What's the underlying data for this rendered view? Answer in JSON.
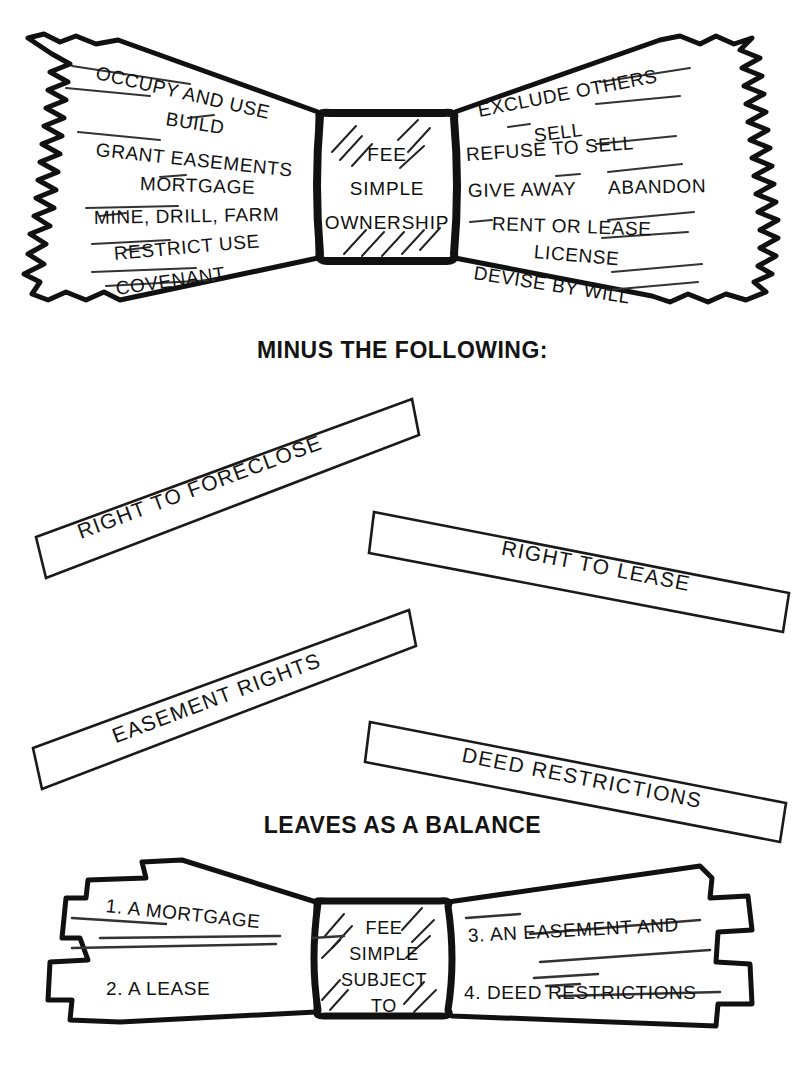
{
  "document": {
    "title": "Fee Simple Ownership — Bundle of Rights Diagram",
    "ink_color": "#111111",
    "paper_color": "#ffffff"
  },
  "top_diagram": {
    "name": "bundle-of-rights-bowtie",
    "core": {
      "line1": "FEE",
      "line2": "SIMPLE",
      "line3": "OWNERSHIP"
    },
    "left_rights": [
      "OCCUPY AND USE",
      "BUILD",
      "GRANT EASEMENTS",
      "MORTGAGE",
      "MINE, DRILL, FARM",
      "RESTRICT USE",
      "COVENANT"
    ],
    "right_rights": [
      "EXCLUDE OTHERS",
      "SELL",
      "REFUSE TO SELL",
      "GIVE AWAY",
      "ABANDON",
      "RENT OR LEASE",
      "LICENSE",
      "DEVISE BY WILL"
    ]
  },
  "minus_heading": "MINUS THE FOLLOWING:",
  "minus_bars": [
    {
      "label": "RIGHT TO FORECLOSE",
      "angle_deg": -20.5
    },
    {
      "label": "RIGHT TO LEASE",
      "angle_deg": 11.0
    },
    {
      "label": "EASEMENT RIGHTS",
      "angle_deg": -20.5
    },
    {
      "label": "DEED RESTRICTIONS",
      "angle_deg": 11.0
    }
  ],
  "leaves_heading": "LEAVES AS A BALANCE",
  "bottom_diagram": {
    "name": "fee-simple-subject-to-bowtie",
    "core": {
      "line1": "FEE",
      "line2": "SIMPLE",
      "line3": "SUBJECT",
      "line4": "TO"
    },
    "left_items": [
      "1. A MORTGAGE",
      "2. A LEASE"
    ],
    "right_items": [
      "3. AN EASEMENT AND",
      "4. DEED RESTRICTIONS"
    ]
  }
}
